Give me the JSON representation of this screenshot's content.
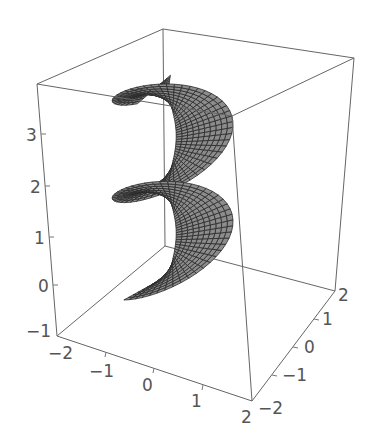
{
  "chart_data": {
    "type": "surface3d",
    "title": "",
    "surface": {
      "fill_color": "#8c8c8c",
      "mesh_color": "#2a2a2a",
      "turns_visible": 3,
      "parametric_hint": "x = v*cos(u), y = v*sin(u), z = u/(2*pi)*... spiral ramp of width ~1 to 2"
    },
    "axes": {
      "x": {
        "label": "",
        "ticks": [
          "-2",
          "-1",
          "0",
          "1",
          "2"
        ],
        "range": [
          -2,
          2
        ]
      },
      "y": {
        "label": "",
        "ticks": [
          "-2",
          "-1",
          "0",
          "1",
          "2"
        ],
        "range": [
          -2,
          2
        ]
      },
      "z": {
        "label": "",
        "ticks": [
          "-1",
          "0",
          "1",
          "2",
          "3"
        ],
        "range": [
          -1,
          3.6
        ]
      }
    },
    "box": true,
    "grid": false,
    "legend": null
  },
  "labels": {
    "z_ticks": [
      "3",
      "2",
      "1",
      "0",
      "−1"
    ],
    "x_ticks": [
      "−2",
      "−1",
      "0",
      "1",
      "2"
    ],
    "y_ticks": [
      "−2",
      "−1",
      "0",
      "1",
      "2"
    ]
  },
  "colors": {
    "box": "#666666",
    "surface": "#8c8c8c",
    "mesh": "#2a2a2a",
    "text": "#555555"
  }
}
